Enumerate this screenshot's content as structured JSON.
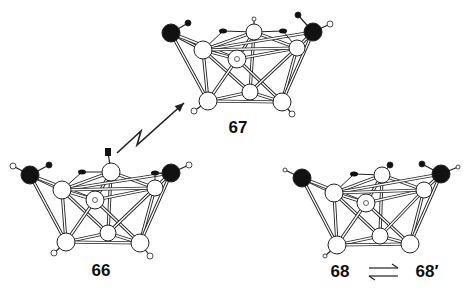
{
  "colors": {
    "bond": "#222222",
    "bond_fill": "#ffffff",
    "atom_open": "#ffffff",
    "atom_dark": "#111111",
    "text": "#111111",
    "background": "#ffffff"
  },
  "labels": [
    {
      "id": "label-67",
      "text": "67",
      "x": 238,
      "y": 128
    },
    {
      "id": "label-66",
      "text": "66",
      "x": 101,
      "y": 271
    },
    {
      "id": "label-68",
      "text": "68",
      "x": 340,
      "y": 272
    },
    {
      "id": "label-68prime",
      "text": "68′",
      "x": 427,
      "y": 272
    }
  ],
  "photolysis_arrow": {
    "points": [
      [
        117,
        153
      ],
      [
        141,
        131
      ],
      [
        137,
        145
      ],
      [
        184,
        103
      ]
    ],
    "head": [
      184,
      103
    ]
  },
  "equilibrium_arrow": {
    "x1": 369,
    "x2": 398,
    "y_top": 268,
    "y_bottom": 276
  },
  "structures": [
    {
      "id": "structure-67",
      "name": "67",
      "atoms": [
        {
          "id": "M1",
          "x": 171,
          "y": 33,
          "r": 9,
          "type": "dark"
        },
        {
          "id": "M2",
          "x": 313,
          "y": 32,
          "r": 9,
          "type": "dark"
        },
        {
          "id": "A1",
          "x": 203,
          "y": 50,
          "r": 9,
          "type": "open"
        },
        {
          "id": "A2",
          "x": 254,
          "y": 32,
          "r": 8,
          "type": "open"
        },
        {
          "id": "A3",
          "x": 237,
          "y": 59,
          "r": 9,
          "type": "open",
          "inner": true
        },
        {
          "id": "A4",
          "x": 297,
          "y": 48,
          "r": 8,
          "type": "open"
        },
        {
          "id": "B1",
          "x": 208,
          "y": 101,
          "r": 9,
          "type": "open"
        },
        {
          "id": "B2",
          "x": 250,
          "y": 92,
          "r": 8,
          "type": "open"
        },
        {
          "id": "B3",
          "x": 282,
          "y": 102,
          "r": 9,
          "type": "open"
        }
      ],
      "bonds": [
        [
          "M1",
          "A1"
        ],
        [
          "M1",
          "A3"
        ],
        [
          "M1",
          "B1"
        ],
        [
          "A1",
          "A2"
        ],
        [
          "A1",
          "A3"
        ],
        [
          "A1",
          "B1"
        ],
        [
          "A1",
          "B2"
        ],
        [
          "A2",
          "A3"
        ],
        [
          "A2",
          "A4"
        ],
        [
          "A2",
          "B2"
        ],
        [
          "A3",
          "B1"
        ],
        [
          "A3",
          "B3"
        ],
        [
          "A3",
          "A4"
        ],
        [
          "A4",
          "M2"
        ],
        [
          "A4",
          "B3"
        ],
        [
          "A4",
          "B2"
        ],
        [
          "M2",
          "B3"
        ],
        [
          "M2",
          "A1"
        ],
        [
          "B1",
          "B2"
        ],
        [
          "B2",
          "B3"
        ],
        [
          "B1",
          "B3"
        ],
        [
          "A1",
          "A4"
        ]
      ],
      "ligands": [
        {
          "from": "M1",
          "x": 188,
          "y": 23,
          "r": 3,
          "type": "dark"
        },
        {
          "from": "M2",
          "x": 298,
          "y": 15,
          "r": 3,
          "type": "dark"
        },
        {
          "from": "M2",
          "x": 330,
          "y": 24,
          "r": 3,
          "type": "open"
        },
        {
          "from": "A2",
          "x": 254,
          "y": 19,
          "r": 2,
          "type": "open"
        },
        {
          "from": "B1",
          "x": 194,
          "y": 111,
          "r": 3,
          "type": "open"
        },
        {
          "from": "B3",
          "x": 292,
          "y": 114,
          "r": 3,
          "type": "open"
        }
      ],
      "bridges": [
        {
          "a": "A1",
          "b": "A2",
          "mx": 223,
          "my": 31,
          "r": 3
        },
        {
          "a": "A2",
          "b": "A4",
          "mx": 283,
          "my": 31,
          "r": 3
        }
      ]
    },
    {
      "id": "structure-66",
      "name": "66",
      "atoms": [
        {
          "id": "M1",
          "x": 30,
          "y": 175,
          "r": 9,
          "type": "dark"
        },
        {
          "id": "M2",
          "x": 171,
          "y": 173,
          "r": 9,
          "type": "dark"
        },
        {
          "id": "A1",
          "x": 62,
          "y": 190,
          "r": 9,
          "type": "open"
        },
        {
          "id": "A2",
          "x": 111,
          "y": 172,
          "r": 9,
          "type": "open"
        },
        {
          "id": "A3",
          "x": 95,
          "y": 200,
          "r": 9,
          "type": "open",
          "inner": true
        },
        {
          "id": "A4",
          "x": 155,
          "y": 188,
          "r": 8,
          "type": "open"
        },
        {
          "id": "B1",
          "x": 66,
          "y": 242,
          "r": 9,
          "type": "open"
        },
        {
          "id": "B2",
          "x": 108,
          "y": 233,
          "r": 8,
          "type": "open"
        },
        {
          "id": "B3",
          "x": 140,
          "y": 243,
          "r": 9,
          "type": "open"
        }
      ],
      "bonds": [
        [
          "M1",
          "A1"
        ],
        [
          "M1",
          "A3"
        ],
        [
          "M1",
          "B1"
        ],
        [
          "A1",
          "A2"
        ],
        [
          "A1",
          "A3"
        ],
        [
          "A1",
          "B1"
        ],
        [
          "A1",
          "B2"
        ],
        [
          "A2",
          "A3"
        ],
        [
          "A2",
          "A4"
        ],
        [
          "A2",
          "B2"
        ],
        [
          "A3",
          "B1"
        ],
        [
          "A3",
          "B3"
        ],
        [
          "A3",
          "A4"
        ],
        [
          "A4",
          "M2"
        ],
        [
          "A4",
          "B3"
        ],
        [
          "A4",
          "B2"
        ],
        [
          "M2",
          "B3"
        ],
        [
          "M2",
          "A1"
        ],
        [
          "B1",
          "B2"
        ],
        [
          "B2",
          "B3"
        ],
        [
          "B1",
          "B3"
        ],
        [
          "A1",
          "A4"
        ]
      ],
      "ligands": [
        {
          "from": "M1",
          "x": 49,
          "y": 165,
          "r": 3,
          "type": "dark"
        },
        {
          "from": "M1",
          "x": 13,
          "y": 166,
          "r": 3,
          "type": "open"
        },
        {
          "from": "M2",
          "x": 189,
          "y": 165,
          "r": 3,
          "type": "open"
        },
        {
          "from": "A2",
          "x": 108,
          "y": 152,
          "r": 3,
          "type": "dark",
          "square": true
        },
        {
          "from": "B1",
          "x": 54,
          "y": 253,
          "r": 3,
          "type": "open"
        },
        {
          "from": "B3",
          "x": 150,
          "y": 256,
          "r": 3,
          "type": "open"
        }
      ],
      "bridges": [
        {
          "a": "A1",
          "b": "A2",
          "mx": 82,
          "my": 172,
          "r": 3
        },
        {
          "a": "A4",
          "b": "M2",
          "mx": 155,
          "my": 173,
          "r": 3
        }
      ]
    },
    {
      "id": "structure-68",
      "name": "68",
      "atoms": [
        {
          "id": "M1",
          "x": 302,
          "y": 178,
          "r": 9,
          "type": "dark"
        },
        {
          "id": "M2",
          "x": 441,
          "y": 174,
          "r": 9,
          "type": "dark"
        },
        {
          "id": "A1",
          "x": 334,
          "y": 193,
          "r": 9,
          "type": "open"
        },
        {
          "id": "A2",
          "x": 382,
          "y": 175,
          "r": 8,
          "type": "open"
        },
        {
          "id": "A3",
          "x": 366,
          "y": 203,
          "r": 9,
          "type": "open",
          "inner": true
        },
        {
          "id": "A4",
          "x": 424,
          "y": 190,
          "r": 8,
          "type": "open"
        },
        {
          "id": "B1",
          "x": 337,
          "y": 245,
          "r": 9,
          "type": "open"
        },
        {
          "id": "B2",
          "x": 380,
          "y": 236,
          "r": 8,
          "type": "open"
        },
        {
          "id": "B3",
          "x": 410,
          "y": 244,
          "r": 9,
          "type": "open"
        }
      ],
      "bonds": [
        [
          "M1",
          "A1"
        ],
        [
          "M1",
          "A3"
        ],
        [
          "M1",
          "B1"
        ],
        [
          "A1",
          "A2"
        ],
        [
          "A1",
          "A3"
        ],
        [
          "A1",
          "B1"
        ],
        [
          "A1",
          "B2"
        ],
        [
          "A2",
          "A3"
        ],
        [
          "A2",
          "A4"
        ],
        [
          "A2",
          "B2"
        ],
        [
          "A3",
          "B1"
        ],
        [
          "A3",
          "B3"
        ],
        [
          "A3",
          "A4"
        ],
        [
          "A4",
          "M2"
        ],
        [
          "A4",
          "B3"
        ],
        [
          "A4",
          "B2"
        ],
        [
          "M2",
          "B3"
        ],
        [
          "M2",
          "A1"
        ],
        [
          "B1",
          "B2"
        ],
        [
          "B2",
          "B3"
        ],
        [
          "B1",
          "B3"
        ],
        [
          "A1",
          "A4"
        ]
      ],
      "ligands": [
        {
          "from": "M1",
          "x": 285,
          "y": 170,
          "r": 2,
          "type": "open"
        },
        {
          "from": "A2",
          "x": 390,
          "y": 165,
          "r": 3,
          "type": "dark"
        },
        {
          "from": "M2",
          "x": 422,
          "y": 164,
          "r": 3,
          "type": "dark"
        },
        {
          "from": "M2",
          "x": 458,
          "y": 167,
          "r": 2,
          "type": "open"
        },
        {
          "from": "B1",
          "x": 325,
          "y": 256,
          "r": 2,
          "type": "open"
        }
      ],
      "bridges": [
        {
          "a": "A1",
          "b": "A2",
          "mx": 354,
          "my": 174,
          "r": 3
        }
      ]
    }
  ]
}
